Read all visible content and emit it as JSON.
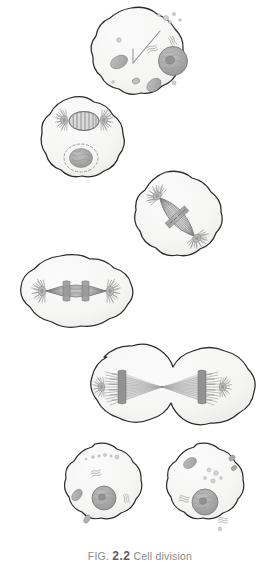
{
  "figure": {
    "caption_prefix": "FIG.",
    "caption_number": "2.2",
    "caption_title": "Cell division",
    "caption_full": "FIG. 2.2 Cell division",
    "background_color": "#ffffff",
    "style": "hand-drawn pencil biology textbook illustration"
  },
  "palette": {
    "membrane_stroke": "#2b2b2b",
    "cytoplasm_fill": "#f6f6f5",
    "cytoplasm_shadow": "#ececea",
    "nucleus_fill": "#a9a9a9",
    "nucleus_stroke": "#7a7a7a",
    "chromatin": "#8f8f8f",
    "organelle_fill": "#b4b4b4",
    "organelle_stroke": "#8c8c8c",
    "vesicle_fill": "#d2d2d2",
    "spindle_fiber": "#9a9a9a",
    "spindle_fiber_dark": "#6f6f6f",
    "aster": "#8b8b8b",
    "caption_text": "#8a8a8a",
    "caption_number": "#5d5d5d"
  },
  "cells": [
    {
      "id": "cell-interphase",
      "stage": "interphase",
      "label": "Interphase cell",
      "position": {
        "cx": 141,
        "cy": 53,
        "rx": 52,
        "ry": 46
      },
      "features": [
        "nucleus",
        "nucleolus",
        "mitochondria",
        "vesicles",
        "endoplasmic-reticulum",
        "centriole-pointer"
      ]
    },
    {
      "id": "cell-prophase",
      "stage": "prophase",
      "label": "Prophase cell",
      "position": {
        "cx": 83,
        "cy": 141,
        "rx": 46,
        "ry": 44
      },
      "features": [
        "spindle-forming",
        "aster-left",
        "aster-right",
        "condensing-chromosomes",
        "dashed-nuclear-envelope",
        "chromatin-mass"
      ]
    },
    {
      "id": "cell-metaphase",
      "stage": "metaphase",
      "label": "Metaphase cell",
      "position": {
        "cx": 177,
        "cy": 216,
        "rx": 50,
        "ry": 45
      },
      "features": [
        "spindle-diagonal",
        "metaphase-plate",
        "aster-upper-left",
        "aster-lower-right",
        "chromosomes-aligned"
      ]
    },
    {
      "id": "cell-anaphase",
      "stage": "anaphase",
      "label": "Anaphase cell",
      "position": {
        "cx": 76,
        "cy": 293,
        "rx": 58,
        "ry": 38
      },
      "features": [
        "spindle-horizontal",
        "chromosomes-separating",
        "aster-left",
        "aster-right",
        "cell-elongating"
      ]
    },
    {
      "id": "cell-telophase",
      "stage": "telophase-cytokinesis",
      "label": "Telophase / cytokinesis cell",
      "position": {
        "cx": 162,
        "cy": 387,
        "rx": 100,
        "ry": 43
      },
      "features": [
        "cleavage-furrow",
        "two-chromosome-masses",
        "converging-spindle-fibers",
        "dumbbell-shape"
      ]
    },
    {
      "id": "cell-daughter-left",
      "stage": "daughter-cell",
      "label": "Daughter cell (left)",
      "position": {
        "cx": 101,
        "cy": 489,
        "rx": 41,
        "ry": 45
      },
      "features": [
        "nucleus",
        "nucleolus",
        "mitochondria",
        "vesicles",
        "endoplasmic-reticulum"
      ]
    },
    {
      "id": "cell-daughter-right",
      "stage": "daughter-cell",
      "label": "Daughter cell (right)",
      "position": {
        "cx": 203,
        "cy": 489,
        "rx": 41,
        "ry": 45
      },
      "features": [
        "nucleus",
        "nucleolus",
        "mitochondria",
        "vesicles",
        "endoplasmic-reticulum"
      ]
    }
  ]
}
